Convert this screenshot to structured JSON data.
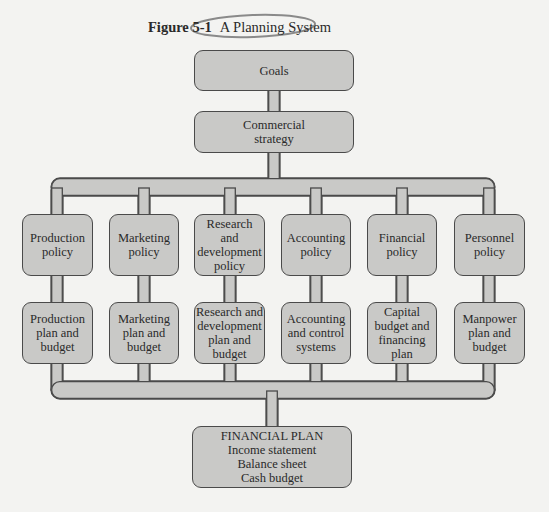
{
  "figure": {
    "number": "Figure 5-1",
    "title": "A Planning System",
    "annotation_color": "#8a8a8a"
  },
  "colors": {
    "box_fill": "#c9c9c7",
    "box_border": "#4a4a4a",
    "connector_fill": "#c9c9c7",
    "background": "#f3f3f1"
  },
  "nodes": {
    "goals": [
      "Goals"
    ],
    "strategy": [
      "Commercial",
      "strategy"
    ],
    "policies": [
      [
        "Production",
        "policy"
      ],
      [
        "Marketing",
        "policy"
      ],
      [
        "Research",
        "and",
        "development",
        "policy"
      ],
      [
        "Accounting",
        "policy"
      ],
      [
        "Financial",
        "policy"
      ],
      [
        "Personnel",
        "policy"
      ]
    ],
    "plans": [
      [
        "Production",
        "plan and",
        "budget"
      ],
      [
        "Marketing",
        "plan and",
        "budget"
      ],
      [
        "Research and",
        "development",
        "plan and",
        "budget"
      ],
      [
        "Accounting",
        "and control",
        "systems"
      ],
      [
        "Capital",
        "budget and",
        "financing",
        "plan"
      ],
      [
        "Manpower",
        "plan and",
        "budget"
      ]
    ],
    "financial_plan": [
      "FINANCIAL PLAN",
      "Income statement",
      "Balance sheet",
      "Cash budget"
    ]
  },
  "edges": [
    [
      "goals",
      "strategy"
    ],
    [
      "strategy",
      "policies.*"
    ],
    [
      "policies.0",
      "plans.0"
    ],
    [
      "policies.1",
      "plans.1"
    ],
    [
      "policies.2",
      "plans.2"
    ],
    [
      "policies.3",
      "plans.3"
    ],
    [
      "policies.4",
      "plans.4"
    ],
    [
      "policies.5",
      "plans.5"
    ],
    [
      "plans.*",
      "financial_plan"
    ]
  ]
}
